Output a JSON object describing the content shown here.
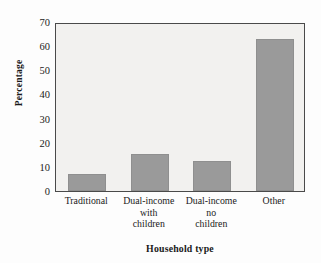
{
  "chart_data": {
    "type": "bar",
    "title": "",
    "xlabel": "Household type",
    "ylabel": "Percentage",
    "categories": [
      "Traditional",
      "Dual-income with children",
      "Dual-income no children",
      "Other"
    ],
    "category_lines": [
      [
        "Traditional"
      ],
      [
        "Dual-income",
        "with",
        "children"
      ],
      [
        "Dual-income",
        "no",
        "children"
      ],
      [
        "Other"
      ]
    ],
    "values": [
      7,
      15.5,
      12.4,
      63
    ],
    "ylim": [
      0,
      70
    ],
    "yticks": [
      0,
      10,
      20,
      30,
      40,
      50,
      60,
      70
    ],
    "ytick_labels": [
      "0",
      "10",
      "20",
      "30",
      "40",
      "50",
      "60",
      "70"
    ],
    "grid": false,
    "legend": null,
    "bar_color": "#9a9a9a",
    "plot_background": "#f2f1ef",
    "axis_color": "#4a4a4a"
  }
}
